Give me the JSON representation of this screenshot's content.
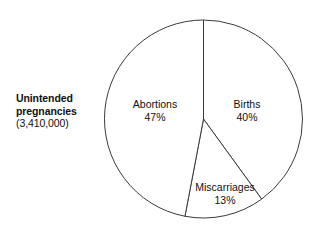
{
  "caption": {
    "line1": "Unintended",
    "line2": "pregnancies",
    "line3": "(3,410,000)"
  },
  "labels": {
    "abortions": {
      "name": "Abortions",
      "value": "47%"
    },
    "births": {
      "name": "Births",
      "value": "40%"
    },
    "miscarriages": {
      "name": "Miscarriages",
      "value": "13%"
    }
  },
  "chart_data": {
    "type": "pie",
    "title": "Unintended pregnancies (3,410,000)",
    "subtitle": "",
    "xlabel": "",
    "ylabel": "",
    "total_label": "(3,410,000)",
    "total_value": 3410000,
    "units": "percent of unintended pregnancies",
    "start_angle_deg": 0,
    "direction": "clockwise",
    "legend": "none (labels drawn inside slices)",
    "grid": false,
    "categories": [
      "Births",
      "Miscarriages",
      "Abortions"
    ],
    "values": [
      40,
      13,
      47
    ],
    "slices": [
      {
        "label": "Births",
        "value": 40,
        "display": "40%",
        "start_angle_deg": 0,
        "end_angle_deg": 144,
        "fill": "#ffffff",
        "stroke": "#3a3a3a"
      },
      {
        "label": "Miscarriages",
        "value": 13,
        "display": "13%",
        "start_angle_deg": 144,
        "end_angle_deg": 190.8,
        "fill": "#ffffff",
        "stroke": "#3a3a3a"
      },
      {
        "label": "Abortions",
        "value": 47,
        "display": "47%",
        "start_angle_deg": 190.8,
        "end_angle_deg": 360,
        "fill": "#ffffff",
        "stroke": "#3a3a3a"
      }
    ]
  },
  "geometry": {
    "center_x": 203.5,
    "center_y": 119,
    "radius": 99
  },
  "colors": {
    "background": "#ffffff",
    "stroke": "#3a3a3a",
    "text": "#111111"
  }
}
